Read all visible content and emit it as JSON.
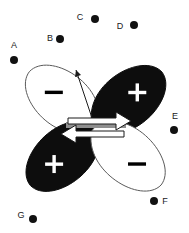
{
  "figure": {
    "width": 189,
    "height": 233,
    "background_color": "#ffffff"
  },
  "orbital": {
    "name": "d-orbital-four-lobes",
    "center": {
      "x": 95,
      "y": 127
    },
    "lobes": [
      {
        "id": "top-left",
        "sign": "–",
        "fill": "#ffffff",
        "sign_color": "#000000",
        "stroke": "#5a5a5a",
        "cx": 63,
        "cy": 100
      },
      {
        "id": "top-right",
        "sign": "+",
        "fill": "#0d0d0d",
        "sign_color": "#ffffff",
        "stroke": "#0d0d0d",
        "cx": 128,
        "cy": 100
      },
      {
        "id": "bottom-left",
        "sign": "+",
        "fill": "#0d0d0d",
        "sign_color": "#ffffff",
        "stroke": "#0d0d0d",
        "cx": 63,
        "cy": 156
      },
      {
        "id": "bottom-right",
        "sign": "–",
        "fill": "#ffffff",
        "sign_color": "#000000",
        "stroke": "#5a5a5a",
        "cx": 128,
        "cy": 156
      }
    ]
  },
  "energy_bar": {
    "name": "orbital-energy-bar",
    "color": "#8f8f8f",
    "x": 66,
    "y": 122,
    "width": 60,
    "height": 6
  },
  "spin_arrows": [
    {
      "id": "spin-up",
      "direction": "up",
      "fill": "#ffffff",
      "stroke": "#1a1a1a"
    },
    {
      "id": "spin-down",
      "direction": "down",
      "fill": "#ffffff",
      "stroke": "#1a1a1a"
    }
  ],
  "pointer": {
    "name": "orbital-axis-pointer",
    "color": "#1a1a1a",
    "from": {
      "x": 95,
      "y": 127
    },
    "to": {
      "x": 76,
      "y": 70
    }
  },
  "points": [
    {
      "label": "A",
      "label_x": 14,
      "label_y": 48,
      "dot_x": 14,
      "dot_y": 60,
      "dot_r": 4
    },
    {
      "label": "B",
      "label_x": 50,
      "label_y": 41,
      "dot_x": 60,
      "dot_y": 39,
      "dot_r": 4
    },
    {
      "label": "C",
      "label_x": 80,
      "label_y": 20,
      "dot_x": 95,
      "dot_y": 19,
      "dot_r": 4
    },
    {
      "label": "D",
      "label_x": 120,
      "label_y": 29,
      "dot_x": 134,
      "dot_y": 25,
      "dot_r": 4
    },
    {
      "label": "E",
      "label_x": 175,
      "label_y": 119,
      "dot_x": 174,
      "dot_y": 130,
      "dot_r": 4
    },
    {
      "label": "F",
      "label_x": 165,
      "label_y": 204,
      "dot_x": 154,
      "dot_y": 201,
      "dot_r": 4
    },
    {
      "label": "G",
      "label_x": 21,
      "label_y": 218,
      "dot_x": 33,
      "dot_y": 219,
      "dot_r": 4
    }
  ],
  "colors": {
    "dot": "#111111",
    "label_text": "#1a1a1a",
    "lobe_outline": "#5a5a5a",
    "lobe_filled": "#0d0d0d",
    "bar_gray": "#8f8f8f"
  }
}
